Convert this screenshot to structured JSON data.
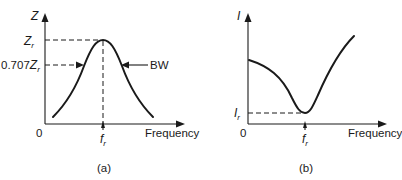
{
  "panels": [
    {
      "caption": "(a)",
      "y_axis_label": "Z",
      "x_axis_label": "Frequency",
      "origin_label": "0",
      "peak_label_main": "Z",
      "peak_label_sub": "r",
      "half_power_label_prefix": "0.707",
      "half_power_label_main": "Z",
      "half_power_label_sub": "r",
      "bandwidth_label": "BW",
      "resonant_freq_main": "f",
      "resonant_freq_sub": "r"
    },
    {
      "caption": "(b)",
      "y_axis_label": "I",
      "x_axis_label": "Frequency",
      "origin_label": "0",
      "min_label_main": "I",
      "min_label_sub": "r",
      "resonant_freq_main": "f",
      "resonant_freq_sub": "r"
    }
  ]
}
